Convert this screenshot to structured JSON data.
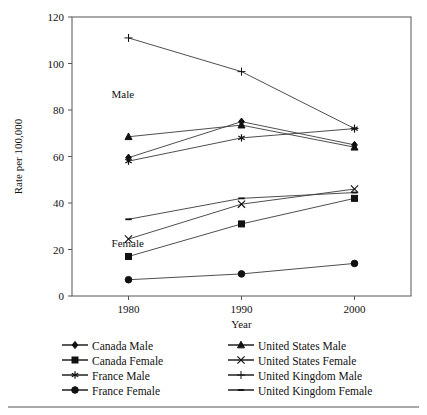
{
  "chart_data": {
    "type": "line",
    "title": "",
    "xlabel": "Year",
    "ylabel": "Rate per 100,000",
    "x": [
      1980,
      1990,
      2000
    ],
    "xtick_labels": [
      "1980",
      "1990",
      "2000"
    ],
    "ytick_labels": [
      "0",
      "20",
      "40",
      "60",
      "80",
      "100",
      "120"
    ],
    "yticks": [
      0,
      20,
      40,
      60,
      80,
      100,
      120
    ],
    "ylim": [
      0,
      120
    ],
    "xlim": [
      1975,
      2005
    ],
    "grid": false,
    "legend_position": "bottom",
    "annotations": [
      {
        "text": "Male",
        "x": 1978.5,
        "y": 85
      },
      {
        "text": "Female",
        "x": 1978.5,
        "y": 21
      }
    ],
    "series": [
      {
        "name": "Canada Male",
        "marker": "diamond",
        "values": [
          59.5,
          75,
          65
        ]
      },
      {
        "name": "Canada  Female",
        "marker": "square",
        "values": [
          17,
          31,
          42
        ]
      },
      {
        "name": "France Male",
        "marker": "asterisk",
        "values": [
          58,
          68,
          72
        ]
      },
      {
        "name": "France Female",
        "marker": "circle",
        "values": [
          7,
          9.5,
          14
        ]
      },
      {
        "name": "United States Male",
        "marker": "triangle",
        "values": [
          68.5,
          73.5,
          64
        ]
      },
      {
        "name": "United States Female",
        "marker": "cross-x",
        "values": [
          24.5,
          39.5,
          46
        ]
      },
      {
        "name": "United Kingdom Male",
        "marker": "plus",
        "values": [
          111,
          96.5,
          72
        ]
      },
      {
        "name": "United Kingdom Female",
        "marker": "dash",
        "values": [
          33,
          42,
          44.5
        ]
      }
    ]
  },
  "legend": {
    "items": [
      {
        "label": "Canada Male",
        "marker": "diamond"
      },
      {
        "label": "United States Male",
        "marker": "triangle"
      },
      {
        "label": "Canada  Female",
        "marker": "square"
      },
      {
        "label": "United States Female",
        "marker": "cross-x"
      },
      {
        "label": "France Male",
        "marker": "asterisk"
      },
      {
        "label": "United Kingdom Male",
        "marker": "plus"
      },
      {
        "label": "France Female",
        "marker": "circle"
      },
      {
        "label": "United Kingdom Female",
        "marker": "dash"
      }
    ]
  },
  "colors": {
    "ink": "#111111",
    "line": "#3a3a3a",
    "frame": "#555555",
    "background": "#ffffff"
  }
}
